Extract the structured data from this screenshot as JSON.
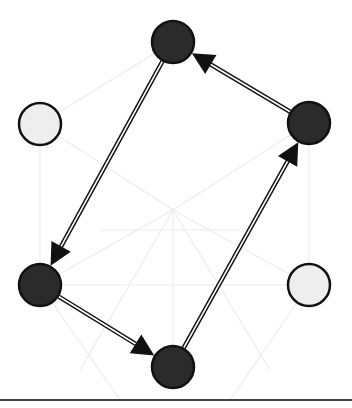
{
  "diagram": {
    "type": "directed-graph",
    "width": 352,
    "height": 408,
    "colors": {
      "background": "#ffffff",
      "node_active_fill": "#2b2b2b",
      "node_inactive_fill": "#eeeeee",
      "node_stroke": "#111111",
      "edge_outer": "#111111",
      "edge_inner": "#ffffff",
      "ghost_line": "#ececec",
      "baseline": "#444444"
    },
    "node_radius": 22,
    "nodes": [
      {
        "id": "top",
        "x": 173,
        "y": 42,
        "state": "active"
      },
      {
        "id": "right",
        "x": 309,
        "y": 123,
        "state": "active"
      },
      {
        "id": "left",
        "x": 40,
        "y": 124,
        "state": "inactive"
      },
      {
        "id": "bottom-left",
        "x": 40,
        "y": 285,
        "state": "active"
      },
      {
        "id": "bottom-right",
        "x": 309,
        "y": 285,
        "state": "inactive"
      },
      {
        "id": "bottom",
        "x": 173,
        "y": 367,
        "state": "active"
      }
    ],
    "edges": [
      {
        "from": "top",
        "to": "bottom-left"
      },
      {
        "from": "bottom-left",
        "to": "bottom"
      },
      {
        "from": "bottom",
        "to": "right"
      },
      {
        "from": "right",
        "to": "top"
      }
    ],
    "ghost_edges": [
      [
        40,
        124,
        173,
        42
      ],
      [
        173,
        42,
        309,
        123
      ],
      [
        40,
        124,
        173,
        210
      ],
      [
        309,
        123,
        173,
        210
      ],
      [
        40,
        285,
        173,
        210
      ],
      [
        309,
        285,
        173,
        210
      ],
      [
        173,
        210,
        173,
        367
      ],
      [
        40,
        285,
        309,
        285
      ],
      [
        40,
        124,
        40,
        285
      ],
      [
        309,
        123,
        309,
        285
      ],
      [
        80,
        370,
        173,
        210
      ],
      [
        270,
        370,
        173,
        210
      ],
      [
        40,
        285,
        120,
        400
      ],
      [
        309,
        285,
        230,
        400
      ],
      [
        100,
        230,
        250,
        230
      ]
    ],
    "baseline": {
      "y": 400,
      "thickness": 2
    }
  }
}
